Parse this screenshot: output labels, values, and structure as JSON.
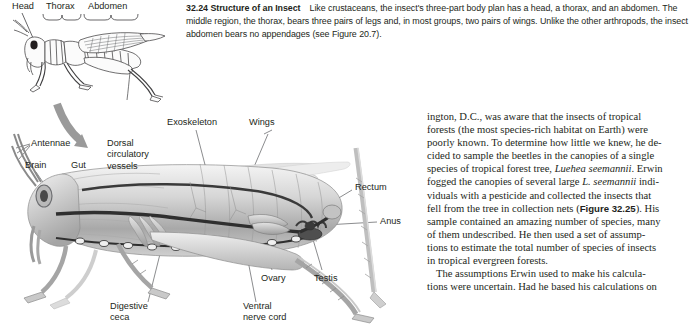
{
  "figure_caption": {
    "number": "32.24",
    "title": "Structure of an Insect",
    "body": "Like crustaceans, the insect's three-part body plan has a head, a thorax, and an abdomen. The middle region, the thorax, bears three pairs of legs and, in most groups, two pairs of wings. Unlike the other arthropods, the insect abdomen bears no appendages (see Figure 20.7)."
  },
  "upper_figure": {
    "labels": [
      {
        "name": "head",
        "text": "Head"
      },
      {
        "name": "thorax",
        "text": "Thorax"
      },
      {
        "name": "abdomen",
        "text": "Abdomen"
      }
    ]
  },
  "lower_figure": {
    "labels": [
      {
        "name": "antennae",
        "text": "Antennae"
      },
      {
        "name": "brain",
        "text": "Brain"
      },
      {
        "name": "gut",
        "text": "Gut"
      },
      {
        "name": "dorsal-circulatory-vessels",
        "line1": "Dorsal",
        "line2": "circulatory",
        "line3": "vessels"
      },
      {
        "name": "exoskeleton",
        "text": "Exoskeleton"
      },
      {
        "name": "wings",
        "text": "Wings"
      },
      {
        "name": "rectum",
        "text": "Rectum"
      },
      {
        "name": "anus",
        "text": "Anus"
      },
      {
        "name": "ovary",
        "text": "Ovary"
      },
      {
        "name": "testis",
        "text": "Testis"
      },
      {
        "name": "digestive-ceca",
        "line1": "Digestive",
        "line2": "ceca"
      },
      {
        "name": "ventral-nerve-cord",
        "line1": "Ventral",
        "line2": "nerve cord"
      }
    ]
  },
  "body_text": {
    "lines": [
      "ington, D.C., was aware that the insects of tropical",
      "forests (the most species-rich habitat on Earth) were",
      "poorly known. To determine how little we knew, he de-",
      "cided to sample the beetles in the canopies of a single",
      "species of tropical forest tree, ",
      ". Erwin",
      "fogged the canopies of several large ",
      " indi-",
      "viduals with a pesticide and collected the insects that",
      "fell from the tree in collection nets (",
      "). His",
      "sample contained an amazing number of species, many",
      "of them undescribed. He then used a set of assump-",
      "tions to estimate the total number of species of insects",
      "in tropical evergreen forests.",
      "The assumptions Erwin used to make his calcula-",
      "tions were uncertain. Had he based his calculations on"
    ],
    "italic_species_full": "Luehea seemannii",
    "italic_species_abbrev": "L. seemannii",
    "bold_figure_ref": "Figure 32.25"
  },
  "colors": {
    "text": "#231f20",
    "arrow": "#9a9a9a",
    "leader_line": "#58595b",
    "art_light": "#e8e8e8",
    "art_mid": "#bcbcbc",
    "art_dark": "#6d6e71",
    "art_outline": "#414042"
  }
}
